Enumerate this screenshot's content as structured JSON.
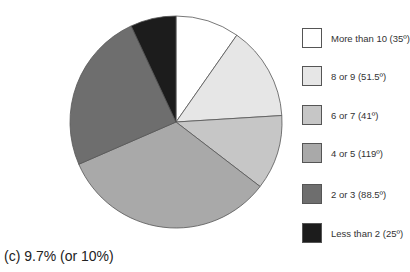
{
  "chart_data": {
    "type": "pie",
    "title": "",
    "caption": "(c) 9.7% (or 10%)",
    "unit": "degrees",
    "start_angle": "12 o'clock, clockwise",
    "slices": [
      {
        "label": "More than 10 (35º)",
        "category": "More than 10",
        "value": 35,
        "color": "#ffffff"
      },
      {
        "label": "8 or 9 (51.5º)",
        "category": "8 or 9",
        "value": 51.5,
        "color": "#e6e6e6"
      },
      {
        "label": "6 or 7 (41º)",
        "category": "6 or 7",
        "value": 41,
        "color": "#c6c6c6"
      },
      {
        "label": "4 or 5 (119º)",
        "category": "4 or 5",
        "value": 119,
        "color": "#a9a9a9"
      },
      {
        "label": "2 or 3 (88.5º)",
        "category": "2 or 3",
        "value": 88.5,
        "color": "#6e6e6e"
      },
      {
        "label": "Less than 2 (25º)",
        "category": "Less than 2",
        "value": 25,
        "color": "#1c1c1c"
      }
    ],
    "legend_position": "right"
  }
}
